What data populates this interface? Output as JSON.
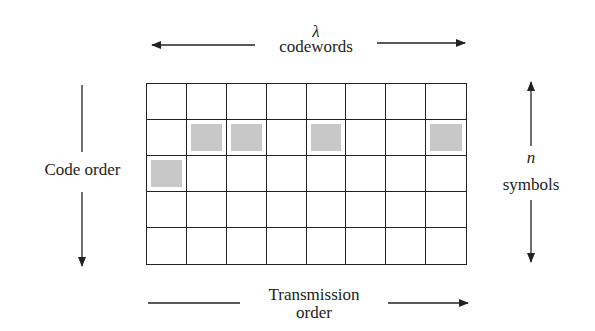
{
  "top_label": {
    "symbol": "λ",
    "text": "codewords"
  },
  "left_label": {
    "text": "Code order"
  },
  "right_label": {
    "symbol": "n",
    "text": "symbols"
  },
  "bottom_label": {
    "line1": "Transmission",
    "line2": "order"
  },
  "grid": {
    "columns": 8,
    "rows": 5,
    "shaded_cells": [
      [
        1,
        1
      ],
      [
        1,
        2
      ],
      [
        1,
        4
      ],
      [
        1,
        7
      ],
      [
        2,
        0
      ]
    ],
    "shade_color": "#c8c8c8",
    "line_color": "#222222"
  }
}
